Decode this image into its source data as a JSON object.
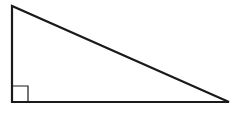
{
  "diagram": {
    "type": "right-triangle",
    "background": "#ffffff",
    "stroke_color": "#1a1a1a",
    "stroke_width": 2.2,
    "vertices": {
      "top": [
        12,
        6
      ],
      "right_angle": [
        12,
        102
      ],
      "right": [
        229,
        102
      ]
    },
    "right_angle_marker": {
      "x": 12,
      "y": 86,
      "size": 16,
      "stroke_width": 1.2
    }
  }
}
